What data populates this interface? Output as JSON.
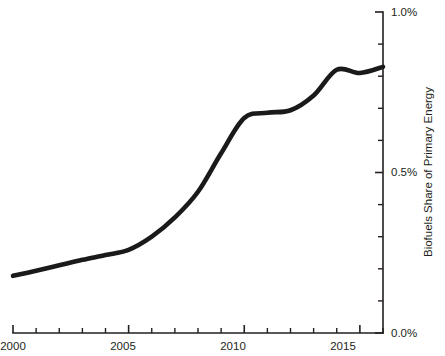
{
  "chart_data": {
    "type": "line",
    "title": "",
    "subtitle": "",
    "xlabel": "",
    "ylabel": "Biofuels Share of Primary Energy",
    "xlim": [
      2000,
      2016
    ],
    "ylim": [
      0.0,
      1.0
    ],
    "grid": false,
    "legend": "none",
    "y_axis_position": "right",
    "y_unit": "%",
    "x_tick_labels": [
      "2000",
      "2005",
      "2010",
      "2015"
    ],
    "x_tick_label_values": [
      2000,
      2005,
      2010,
      2015
    ],
    "x_tick_values": [
      2000,
      2001,
      2002,
      2003,
      2004,
      2005,
      2006,
      2007,
      2008,
      2009,
      2010,
      2011,
      2012,
      2013,
      2014,
      2015,
      2016
    ],
    "y_tick_labels": [
      "0.0%",
      "0.5%",
      "1.0%"
    ],
    "y_tick_label_values": [
      0.0,
      0.5,
      1.0
    ],
    "y_tick_values": [
      0.0,
      0.1,
      0.2,
      0.3,
      0.4,
      0.5,
      0.6,
      0.7,
      0.8,
      0.9,
      1.0
    ],
    "series": [
      {
        "name": "Biofuels Share of Primary Energy",
        "color": "#1a1a1a",
        "x": [
          2000,
          2001,
          2002,
          2003,
          2004,
          2005,
          2006,
          2007,
          2008,
          2009,
          2010,
          2011,
          2012,
          2013,
          2014,
          2015,
          2016
        ],
        "values": [
          0.178,
          0.194,
          0.211,
          0.228,
          0.243,
          0.259,
          0.3,
          0.36,
          0.44,
          0.56,
          0.67,
          0.686,
          0.694,
          0.74,
          0.82,
          0.81,
          0.829
        ]
      }
    ]
  },
  "axis": {
    "y_label": "Biofuels Share of Primary Energy",
    "y_top_label": "1.0%",
    "y_mid_label": "0.5%",
    "y_bottom_label": "0.0%",
    "x_label_2000": "2000",
    "x_label_2005": "2005",
    "x_label_2010": "2010",
    "x_label_2015": "2015"
  },
  "style": {
    "line_color": "#1a1a1a",
    "axis_color": "#231f20",
    "background": "#ffffff"
  }
}
